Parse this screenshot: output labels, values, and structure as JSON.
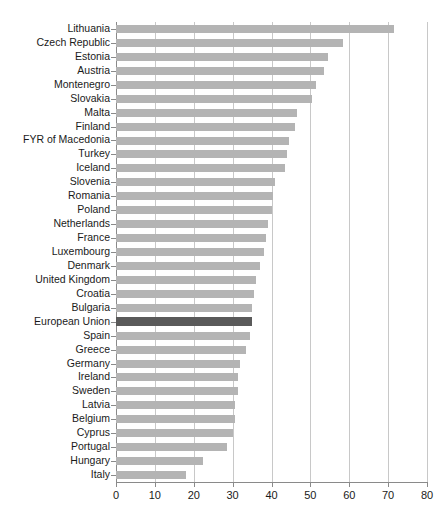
{
  "chart_data": {
    "type": "bar",
    "orientation": "horizontal",
    "title": "",
    "subtitle": "",
    "xlabel": "",
    "ylabel": "",
    "xlim": [
      0,
      80
    ],
    "ylim": null,
    "grid": true,
    "legend": null,
    "xticks": [
      0,
      10,
      20,
      30,
      40,
      50,
      60,
      70,
      80
    ],
    "xtick_labels": [
      "0",
      "10",
      "20",
      "30",
      "40",
      "50",
      "60",
      "70",
      "80"
    ],
    "categories": [
      "Lithuania",
      "Czech Republic",
      "Estonia",
      "Austria",
      "Montenegro",
      "Slovakia",
      "Malta",
      "Finland",
      "FYR of Macedonia",
      "Turkey",
      "Iceland",
      "Slovenia",
      "Romania",
      "Poland",
      "Netherlands",
      "France",
      "Luxembourg",
      "Denmark",
      "United Kingdom",
      "Croatia",
      "Bulgaria",
      "European Union",
      "Spain",
      "Greece",
      "Germany",
      "Ireland",
      "Sweden",
      "Latvia",
      "Belgium",
      "Cyprus",
      "Portugal",
      "Hungary",
      "Italy"
    ],
    "values": [
      71.5,
      58.5,
      54.5,
      53.5,
      51.5,
      50.5,
      46.5,
      46.0,
      44.5,
      44.0,
      43.5,
      41.0,
      40.5,
      40.0,
      39.0,
      38.5,
      38.0,
      37.0,
      36.0,
      35.5,
      35.0,
      35.0,
      34.5,
      33.5,
      32.0,
      31.5,
      31.5,
      30.5,
      30.5,
      30.0,
      28.5,
      22.5,
      18.0
    ],
    "highlight_category": "European Union",
    "colors": {
      "bar": "#b4b4b4",
      "highlight_bar": "#5a5a5a",
      "gridline": "#c8c8c8",
      "axis": "#8a8a8a",
      "text": "#1a1a1a",
      "background": "#ffffff"
    }
  }
}
